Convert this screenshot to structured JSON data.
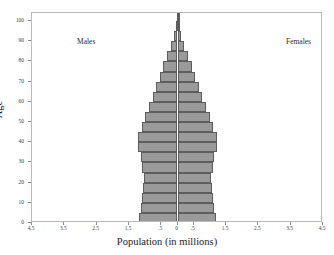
{
  "figure": {
    "cut_off_title": "",
    "group_left_label": "Males",
    "group_right_label": "Females"
  },
  "chart_data": {
    "type": "bar",
    "orientation": "population-pyramid",
    "title": "",
    "xlabel": "Population (in millions)",
    "ylabel": "Age",
    "xlim": [
      -4.5,
      4.5
    ],
    "ylim": [
      0,
      104
    ],
    "grid": false,
    "legend": "in-plot corners: Males (left), Females (right)",
    "xticks": [
      -4.5,
      -3.5,
      -2.5,
      -1.5,
      -0.5,
      0,
      0.5,
      1.5,
      2.5,
      3.5,
      4.5
    ],
    "xtick_labels": [
      "4.5",
      "3.5",
      "2.5",
      "1.5",
      ".5",
      "0",
      ".5",
      "1.5",
      "2.5",
      "3.5",
      "4.5"
    ],
    "yticks": [
      0,
      10,
      20,
      30,
      40,
      50,
      60,
      70,
      80,
      90,
      100
    ],
    "ytick_labels": [
      "0",
      "10",
      "20",
      "30",
      "40",
      "50",
      "60",
      "70",
      "80",
      "90",
      "100"
    ],
    "age_band_width": 5,
    "categories": [
      "0-4",
      "5-9",
      "10-14",
      "15-19",
      "20-24",
      "25-29",
      "30-34",
      "35-39",
      "40-44",
      "45-49",
      "50-54",
      "55-59",
      "60-64",
      "65-69",
      "70-74",
      "75-79",
      "80-84",
      "85-89",
      "90-94",
      "95-99",
      "100+"
    ],
    "age_starts": [
      0,
      5,
      10,
      15,
      20,
      25,
      30,
      35,
      40,
      45,
      50,
      55,
      60,
      65,
      70,
      75,
      80,
      85,
      90,
      95,
      100
    ],
    "series": [
      {
        "name": "Males",
        "side": "left",
        "values": [
          1.18,
          1.13,
          1.09,
          1.06,
          1.05,
          1.09,
          1.14,
          1.22,
          1.22,
          1.1,
          0.99,
          0.88,
          0.77,
          0.66,
          0.55,
          0.44,
          0.33,
          0.2,
          0.1,
          0.04,
          0.01
        ]
      },
      {
        "name": "Females",
        "side": "right",
        "values": [
          1.18,
          1.13,
          1.09,
          1.06,
          1.05,
          1.09,
          1.14,
          1.22,
          1.22,
          1.1,
          0.99,
          0.88,
          0.77,
          0.66,
          0.55,
          0.44,
          0.33,
          0.2,
          0.1,
          0.04,
          0.01
        ]
      }
    ],
    "bar_fill_color": "#9a9a9a",
    "bar_edge_color": "#5d5d5d"
  }
}
